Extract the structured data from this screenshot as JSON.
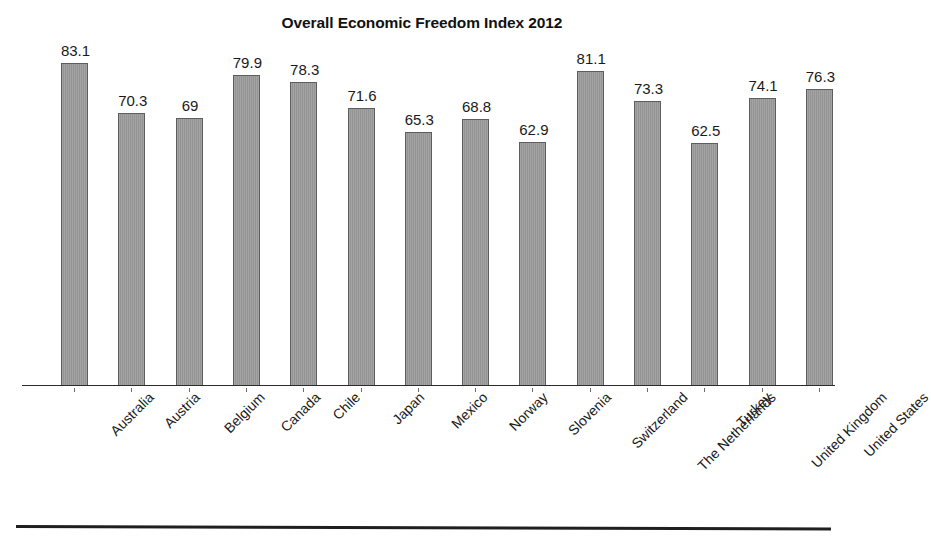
{
  "figure": {
    "background_color": "#ffffff",
    "bar_fill_color": "#9a9a9a",
    "bar_outline_color": "#5d5d5d",
    "axis_color": "#2b2b2b",
    "text_color": "#1a1a1a"
  },
  "chart_data": {
    "type": "bar",
    "title": "Overall Economic Freedom Index 2012",
    "xlabel": "",
    "ylabel": "",
    "ylim": [
      0,
      88
    ],
    "grid": false,
    "legend": "none",
    "axis_visible": {
      "x": true,
      "y": false
    },
    "value_labels_shown": true,
    "categories": [
      "Australia",
      "Austria",
      "Belgium",
      "Canada",
      "Chile",
      "Japan",
      "Mexico",
      "Norway",
      "Slovenia",
      "Switzerland",
      "The Netherlands",
      "Turkey",
      "United Kingdom",
      "United States"
    ],
    "values": [
      83.1,
      70.3,
      69,
      79.9,
      78.3,
      71.6,
      65.3,
      68.8,
      62.9,
      81.1,
      73.3,
      62.5,
      74.1,
      76.3
    ],
    "value_label_text": [
      "83.1",
      "70.3",
      "69",
      "79.9",
      "78.3",
      "71.6",
      "65.3",
      "68.8",
      "62.9",
      "81.1",
      "73.3",
      "62.5",
      "74.1",
      "76.3"
    ]
  }
}
